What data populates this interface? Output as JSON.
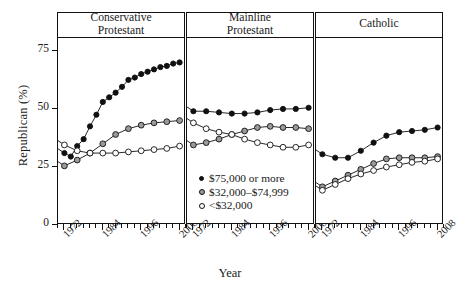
{
  "chart_data": {
    "type": "line",
    "title": "",
    "xlabel": "Year",
    "ylabel": "Republican (%)",
    "ylim": [
      0,
      80
    ],
    "yticks": [
      0,
      25,
      50,
      75
    ],
    "xlim": [
      1970,
      2010
    ],
    "xticks": [
      1972,
      1984,
      1996,
      2008
    ],
    "xtick_labels": [
      "1972",
      "1984",
      "1996",
      "2008"
    ],
    "minor_xticks_count": 20,
    "grid": false,
    "legend_position": "inside-center-bottom",
    "facet_layout": "1x3",
    "panels": [
      {
        "name": "conservative-protestant",
        "label_line1": "Conservative",
        "label_line2": "Protestant",
        "series": [
          {
            "name": "$75,000 or more",
            "marker": "filled-circle",
            "color": "#111111",
            "x": [
              1972,
              1974,
              1976,
              1978,
              1980,
              1982,
              1984,
              1986,
              1988,
              1990,
              1992,
              1994,
              1996,
              1998,
              2000,
              2002,
              2004,
              2006,
              2008
            ],
            "y": [
              30.5,
              29.0,
              33.5,
              36.5,
              42.0,
              47.0,
              52.5,
              54.5,
              56.5,
              59.0,
              62.0,
              63.0,
              64.5,
              65.5,
              66.5,
              67.5,
              68.0,
              69.0,
              69.5
            ]
          },
          {
            "name": "$32,000-$74,999",
            "marker": "gray-circle",
            "color": "#9a9a9a",
            "x": [
              1972,
              1976,
              1980,
              1984,
              1988,
              1992,
              1996,
              2000,
              2004,
              2008
            ],
            "y": [
              25.0,
              27.5,
              30.5,
              34.5,
              38.5,
              41.0,
              42.5,
              43.5,
              44.0,
              44.5
            ]
          },
          {
            "name": "<$32,000",
            "marker": "open-circle",
            "color": "#ffffff",
            "x": [
              1972,
              1976,
              1980,
              1984,
              1988,
              1992,
              1996,
              2000,
              2004,
              2008
            ],
            "y": [
              34.0,
              31.5,
              30.5,
              30.5,
              30.5,
              31.0,
              31.5,
              32.0,
              32.5,
              33.5
            ]
          }
        ]
      },
      {
        "name": "mainline-protestant",
        "label_line1": "Mainline",
        "label_line2": "Protestant",
        "series": [
          {
            "name": "$75,000 or more",
            "marker": "filled-circle",
            "color": "#111111",
            "x": [
              1972,
              1976,
              1980,
              1984,
              1988,
              1992,
              1996,
              2000,
              2004,
              2008
            ],
            "y": [
              48.5,
              48.5,
              48.0,
              47.5,
              47.5,
              48.0,
              49.0,
              49.5,
              49.5,
              50.0
            ]
          },
          {
            "name": "$32,000-$74,999",
            "marker": "gray-circle",
            "color": "#9a9a9a",
            "x": [
              1972,
              1976,
              1980,
              1984,
              1988,
              1992,
              1996,
              2000,
              2004,
              2008
            ],
            "y": [
              34.0,
              35.0,
              36.5,
              38.5,
              40.0,
              41.5,
              42.0,
              41.5,
              41.5,
              41.0
            ]
          },
          {
            "name": "<$32,000",
            "marker": "open-circle",
            "color": "#ffffff",
            "x": [
              1972,
              1976,
              1980,
              1984,
              1988,
              1992,
              1996,
              2000,
              2004,
              2008
            ],
            "y": [
              43.5,
              41.0,
              39.5,
              38.5,
              36.5,
              35.0,
              34.0,
              33.0,
              33.0,
              34.0
            ]
          }
        ]
      },
      {
        "name": "catholic",
        "label_line1": "Catholic",
        "label_line2": "",
        "series": [
          {
            "name": "$75,000 or more",
            "marker": "filled-circle",
            "color": "#111111",
            "x": [
              1972,
              1976,
              1980,
              1984,
              1988,
              1992,
              1996,
              2000,
              2004,
              2008
            ],
            "y": [
              30.0,
              28.5,
              28.5,
              31.5,
              35.0,
              38.0,
              39.5,
              40.0,
              40.5,
              41.5
            ]
          },
          {
            "name": "$32,000-$74,999",
            "marker": "gray-circle",
            "color": "#9a9a9a",
            "x": [
              1972,
              1976,
              1980,
              1984,
              1988,
              1992,
              1996,
              2000,
              2004,
              2008
            ],
            "y": [
              16.0,
              18.5,
              21.0,
              23.5,
              26.0,
              28.0,
              28.5,
              28.5,
              28.5,
              29.0
            ]
          },
          {
            "name": "<$32,000",
            "marker": "open-circle",
            "color": "#ffffff",
            "x": [
              1972,
              1976,
              1980,
              1984,
              1988,
              1992,
              1996,
              2000,
              2004,
              2008
            ],
            "y": [
              14.5,
              17.0,
              19.5,
              21.5,
              23.0,
              24.5,
              25.5,
              26.5,
              27.0,
              28.0
            ]
          }
        ]
      }
    ],
    "legend": [
      {
        "label": "$75,000 or more",
        "marker": "filled-circle"
      },
      {
        "label": "$32,000–$74,999",
        "marker": "gray-circle"
      },
      {
        "label": "<$32,000",
        "marker": "open-circle"
      }
    ]
  }
}
